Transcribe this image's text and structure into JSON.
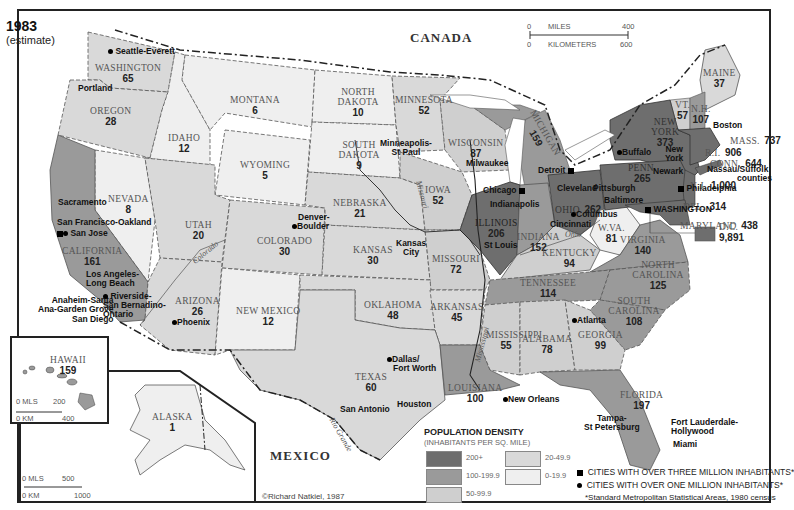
{
  "map": {
    "title": "1983",
    "subtitle": "(estimate)",
    "countries": {
      "canada": "CANADA",
      "mexico": "MEXICO"
    },
    "credit": "©Richard Natkiel, 1987",
    "colors": {
      "d200": "#6e6e6e",
      "d100": "#9a9a9a",
      "d50": "#c8c8c8",
      "d20": "#d9d9d9",
      "d0": "#efefef",
      "border": "#222222"
    }
  },
  "scale_main": {
    "miles_label": "MILES",
    "miles_0": "0",
    "miles_max": "400",
    "km_label": "KILOMETERS",
    "km_0": "0",
    "km_max": "600"
  },
  "scale_hawaii": {
    "mls": "0  MLS",
    "mls_max": "200",
    "km": "0  KM",
    "km_max": "400"
  },
  "scale_alaska": {
    "mls": "0  MLS",
    "mls_max": "500",
    "km": "0  KM",
    "km_max": "1000"
  },
  "states": [
    {
      "name": "WASHINGTON",
      "density": "65"
    },
    {
      "name": "OREGON",
      "density": "28"
    },
    {
      "name": "IDAHO",
      "density": "12"
    },
    {
      "name": "MONTANA",
      "density": "6"
    },
    {
      "name": "WYOMING",
      "density": "5"
    },
    {
      "name": "NORTH DAKOTA",
      "density": "10"
    },
    {
      "name": "SOUTH DAKOTA",
      "density": "9"
    },
    {
      "name": "MINNESOTA",
      "density": "52"
    },
    {
      "name": "WISCONSIN",
      "density": "87"
    },
    {
      "name": "MICHIGAN",
      "density": "159"
    },
    {
      "name": "NEVADA",
      "density": "8"
    },
    {
      "name": "UTAH",
      "density": "20"
    },
    {
      "name": "CALIFORNIA",
      "density": "161"
    },
    {
      "name": "COLORADO",
      "density": "30"
    },
    {
      "name": "NEBRASKA",
      "density": "21"
    },
    {
      "name": "IOWA",
      "density": "52"
    },
    {
      "name": "ILLINOIS",
      "density": "206"
    },
    {
      "name": "INDIANA",
      "density": "152"
    },
    {
      "name": "OHIO",
      "density": "262"
    },
    {
      "name": "KANSAS",
      "density": "30"
    },
    {
      "name": "MISSOURI",
      "density": "72"
    },
    {
      "name": "KENTUCKY",
      "density": "94"
    },
    {
      "name": "W.VA.",
      "density": "81"
    },
    {
      "name": "VIRGINIA",
      "density": "140"
    },
    {
      "name": "ARIZONA",
      "density": "26"
    },
    {
      "name": "NEW MEXICO",
      "density": "12"
    },
    {
      "name": "OKLAHOMA",
      "density": "48"
    },
    {
      "name": "ARKANSAS",
      "density": "45"
    },
    {
      "name": "TENNESSEE",
      "density": "114"
    },
    {
      "name": "NORTH CAROLINA",
      "density": "125"
    },
    {
      "name": "SOUTH CAROLINA",
      "density": "108"
    },
    {
      "name": "TEXAS",
      "density": "60"
    },
    {
      "name": "LOUISIANA",
      "density": "100"
    },
    {
      "name": "MISSISSIPPI",
      "density": "55"
    },
    {
      "name": "ALABAMA",
      "density": "78"
    },
    {
      "name": "GEORGIA",
      "density": "99"
    },
    {
      "name": "FLORIDA",
      "density": "197"
    },
    {
      "name": "MAINE",
      "density": "37"
    },
    {
      "name": "VT.",
      "density": "57"
    },
    {
      "name": "N.H.",
      "density": "107"
    },
    {
      "name": "NEW YORK",
      "density": "373"
    },
    {
      "name": "MASS.",
      "density": "737"
    },
    {
      "name": "R.I.",
      "density": "906"
    },
    {
      "name": "CONN.",
      "density": "644"
    },
    {
      "name": "N.J.",
      "density": "1,000"
    },
    {
      "name": "PENN.",
      "density": "265"
    },
    {
      "name": "DEL.",
      "density": "314"
    },
    {
      "name": "MARYLAND",
      "density": "438"
    },
    {
      "name": "D.C.",
      "density": "9,891"
    },
    {
      "name": "HAWAII",
      "density": "159"
    },
    {
      "name": "ALASKA",
      "density": "1"
    }
  ],
  "cities": {
    "seattle": "Seattle-Everett",
    "portland": "Portland",
    "sacramento": "Sacramento",
    "sf": "San Francisco-Oakland",
    "sanjose": "San Jose",
    "la": "Los Angeles-\nLong Beach",
    "la1": "Los Angeles-",
    "la2": "Long Beach",
    "anaheim1": "Anaheim-Santa",
    "anaheim2": "Ana-Garden Grove",
    "riverside1": "Riverside-",
    "riverside2": "San Bernadino-",
    "riverside3": "Ontario",
    "sandiego": "San Diego",
    "phoenix": "Phoenix",
    "denver1": "Denver-",
    "denver2": "Boulder",
    "minneapolis1": "Minneapolis-",
    "minneapolis2": "St Paul",
    "milwaukee": "Milwaukee",
    "kc1": "Kansas",
    "kc2": "City",
    "chicago": "Chicago",
    "indianapolis": "Indianapolis",
    "stlouis": "St Louis",
    "detroit": "Detroit",
    "cleveland": "Cleveland",
    "pittsburgh": "Pittsburgh",
    "columbus": "Columbus",
    "cincinnati": "Cincinnati",
    "buffalo": "Buffalo",
    "newyork1": "New",
    "newyork2": "York",
    "newark": "Newark",
    "boston": "Boston",
    "nassau1": "Nassau/Suffolk",
    "nassau2": "counties",
    "philadelphia": "Philadelphia",
    "baltimore": "Baltimore",
    "washington": "WASHINGTON",
    "dallas1": "Dallas/",
    "dallas2": "Fort Worth",
    "houston": "Houston",
    "sanantonio": "San Antonio",
    "neworleans": "New Orleans",
    "atlanta": "Atlanta",
    "tampa1": "Tampa-",
    "tampa2": "St Petersburg",
    "ftl1": "Fort Lauderdale-",
    "ftl2": "Hollywood",
    "miami": "Miami"
  },
  "rivers": {
    "missouri": "Missouri",
    "colorado": "Colorado",
    "ohio": "Ohio",
    "mississippi": "Mississippi",
    "riogrande": "Rio Grande"
  },
  "legend": {
    "title": "POPULATION DENSITY",
    "subtitle": "(INHABITANTS PER SQ. MILE)",
    "items": [
      {
        "label": "200+",
        "color": "#6e6e6e"
      },
      {
        "label": "100-199.9",
        "color": "#9a9a9a"
      },
      {
        "label": "50-99.9",
        "color": "#cfcfcf"
      },
      {
        "label": "20-49.9",
        "color": "#d9d9d9"
      },
      {
        "label": "0-19.9",
        "color": "#efefef"
      }
    ],
    "key_three_million": "CITIES WITH OVER THREE MILLION INHABITANTS*",
    "key_one_million": "CITIES WITH OVER ONE MILLION INHABITANTS*",
    "footnote": "*Standard Metropolitan Statistical Areas, 1980 census"
  }
}
